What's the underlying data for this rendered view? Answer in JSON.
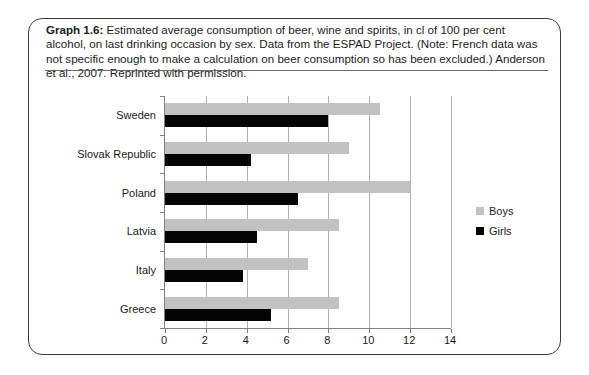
{
  "caption": {
    "label": "Graph 1.6:",
    "text": "Estimated average consumption of beer, wine and spirits, in cl of 100 per cent alcohol, on last drinking occasion by sex. Data from the ESPAD Project. (Note: French data was not specific enough to make a calculation on beer consumption so has been excluded.) Anderson et al., 2007. Reprinted with permission."
  },
  "chart_data": {
    "type": "bar",
    "orientation": "horizontal",
    "title": "",
    "xlabel": "",
    "ylabel": "",
    "categories": [
      "Sweden",
      "Slovak Republic",
      "Poland",
      "Latvia",
      "Italy",
      "Greece"
    ],
    "series": [
      {
        "name": "Boys",
        "color": "#c2c2c2",
        "values": [
          10.5,
          9.0,
          12.0,
          8.5,
          7.0,
          8.5
        ]
      },
      {
        "name": "Girls",
        "color": "#050505",
        "values": [
          8.0,
          4.2,
          6.5,
          4.5,
          3.8,
          5.2
        ]
      }
    ],
    "xlim": [
      0,
      14
    ],
    "xticks": [
      0,
      2,
      4,
      6,
      8,
      10,
      12,
      14
    ],
    "grid": "vertical",
    "legend_position": "right",
    "axis_color": "#808080"
  }
}
